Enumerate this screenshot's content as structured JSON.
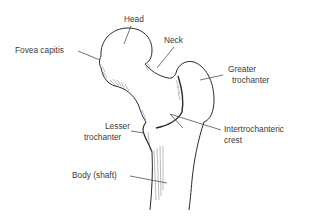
{
  "diagram": {
    "labels": {
      "head": "Head",
      "fovea_capitis": "Fovea capitis",
      "neck": "Neck",
      "greater_trochanter_line1": "Greater",
      "greater_trochanter_line2": "trochanter",
      "lesser_trochanter_line1": "Lesser",
      "lesser_trochanter_line2": "trochanter",
      "intertrochanteric_crest_line1": "Intertrochanteric",
      "intertrochanteric_crest_line2": "crest",
      "body_shaft": "Body (shaft)"
    },
    "colors": {
      "outline": "#2a2a2a",
      "leader": "#3a3a3a",
      "text": "#3a3a3a",
      "background": "#ffffff"
    }
  }
}
